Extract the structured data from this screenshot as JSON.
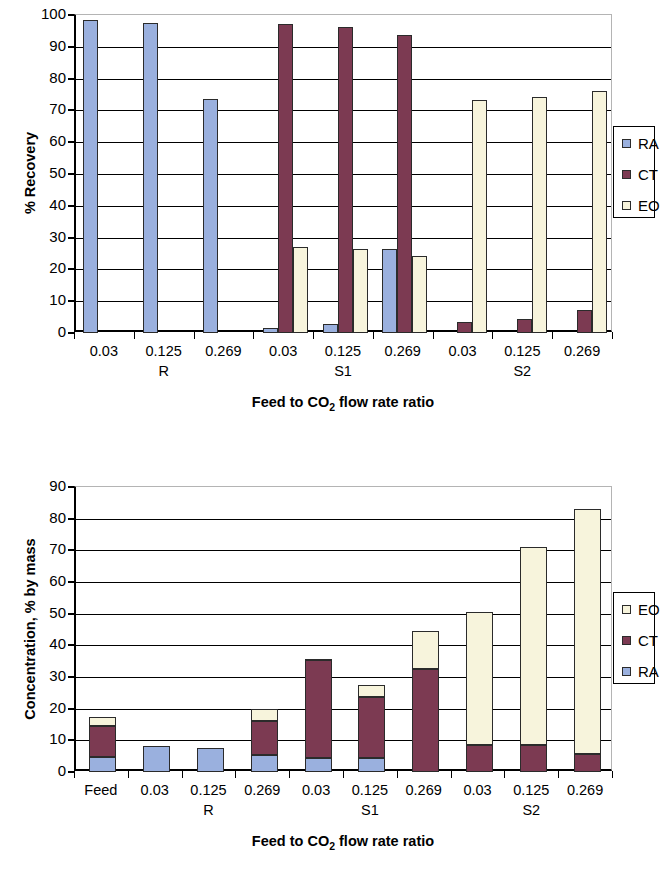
{
  "figure": {
    "panels": [
      "recovery-chart",
      "concentration-chart"
    ]
  },
  "chart_data": [
    {
      "id": "recovery-chart",
      "type": "bar",
      "title": "",
      "xlabel": "Feed to CO2 flow rate ratio",
      "xlabel_parts": {
        "pre": "Feed to CO",
        "sub": "2",
        "post": " flow rate ratio"
      },
      "ylabel": "% Recovery",
      "ylim": [
        0,
        100
      ],
      "yticks": [
        0,
        10,
        20,
        30,
        40,
        50,
        60,
        70,
        80,
        90,
        100
      ],
      "ytick_labels": [
        "0",
        "10",
        "20",
        "30",
        "40",
        "50",
        "60",
        "70",
        "80",
        "90",
        "100"
      ],
      "grid": true,
      "grid_axis": "y",
      "legend_position": "right",
      "categories": [
        "0.03",
        "0.125",
        "0.269",
        "0.03",
        "0.125",
        "0.269",
        "0.03",
        "0.125",
        "0.269"
      ],
      "groups": [
        {
          "label": "R",
          "categories": [
            "0.03",
            "0.125",
            "0.269"
          ]
        },
        {
          "label": "S1",
          "categories": [
            "0.03",
            "0.125",
            "0.269"
          ]
        },
        {
          "label": "S2",
          "categories": [
            "0.03",
            "0.125",
            "0.269"
          ]
        }
      ],
      "series": [
        {
          "name": "RA",
          "color": "#9AB0DE",
          "values": [
            98.5,
            97.5,
            73.7,
            1.6,
            2.8,
            26.3,
            0,
            0,
            0
          ]
        },
        {
          "name": "CT",
          "color": "#7C3A52",
          "values": [
            0,
            0,
            0,
            97.2,
            96.2,
            93.6,
            3.5,
            4.5,
            7.2
          ]
        },
        {
          "name": "EO",
          "color": "#F7F4DC",
          "values": [
            0,
            0,
            0,
            27.0,
            26.3,
            24.3,
            73.4,
            74.2,
            76.0
          ]
        }
      ],
      "legend": [
        {
          "label": "RA",
          "color": "#9AB0DE"
        },
        {
          "label": "CT",
          "color": "#7C3A52"
        },
        {
          "label": "EO",
          "color": "#F7F4DC"
        }
      ]
    },
    {
      "id": "concentration-chart",
      "type": "bar",
      "stacked": true,
      "title": "",
      "xlabel": "Feed to CO2 flow rate ratio",
      "xlabel_parts": {
        "pre": "Feed to CO",
        "sub": "2",
        "post": " flow rate ratio"
      },
      "ylabel": "Concentration, % by mass",
      "ylim": [
        0,
        90
      ],
      "yticks": [
        0,
        10,
        20,
        30,
        40,
        50,
        60,
        70,
        80,
        90
      ],
      "ytick_labels": [
        "0",
        "10",
        "20",
        "30",
        "40",
        "50",
        "60",
        "70",
        "80",
        "90"
      ],
      "grid": true,
      "grid_axis": "y",
      "legend_position": "right",
      "categories": [
        "Feed",
        "0.03",
        "0.125",
        "0.269",
        "0.03",
        "0.125",
        "0.269",
        "0.03",
        "0.125",
        "0.269"
      ],
      "groups": [
        {
          "label": "",
          "categories": [
            "Feed"
          ]
        },
        {
          "label": "R",
          "categories": [
            "0.03",
            "0.125",
            "0.269"
          ]
        },
        {
          "label": "S1",
          "categories": [
            "0.03",
            "0.125",
            "0.269"
          ]
        },
        {
          "label": "S2",
          "categories": [
            "0.03",
            "0.125",
            "0.269"
          ]
        }
      ],
      "series": [
        {
          "name": "RA",
          "color": "#9AB0DE",
          "values": [
            4.8,
            8.1,
            7.5,
            5.5,
            4.3,
            4.4,
            0,
            0,
            0,
            0
          ]
        },
        {
          "name": "CT",
          "color": "#7C3A52",
          "values": [
            9.6,
            0,
            0,
            10.5,
            31.3,
            19.3,
            32.6,
            8.5,
            8.6,
            5.7
          ]
        },
        {
          "name": "EO",
          "color": "#F7F4DC",
          "values": [
            3.1,
            0,
            0,
            3.8,
            0.2,
            3.9,
            12.0,
            42.0,
            62.3,
            77.2
          ]
        }
      ],
      "totals": [
        17.5,
        8.1,
        7.5,
        19.8,
        35.8,
        27.6,
        44.6,
        50.5,
        70.9,
        82.9
      ],
      "legend": [
        {
          "label": "EO",
          "color": "#F7F4DC"
        },
        {
          "label": "CT",
          "color": "#7C3A52"
        },
        {
          "label": "RA",
          "color": "#9AB0DE"
        }
      ]
    }
  ]
}
